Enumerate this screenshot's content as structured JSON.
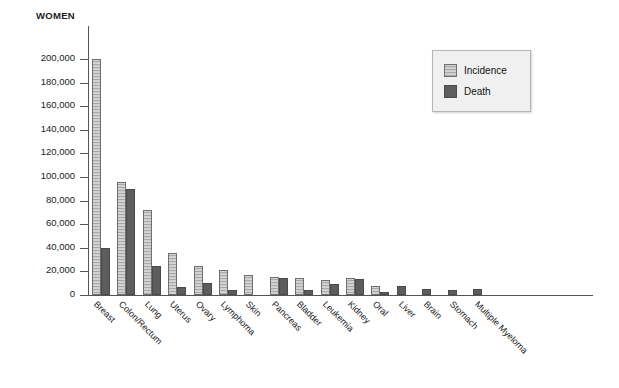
{
  "chart_data": {
    "type": "bar",
    "title": "",
    "ylabel": "WOMEN",
    "xlabel": "",
    "ylim": [
      0,
      210000
    ],
    "grid": false,
    "legend_position": "top-right",
    "ytick_labels": [
      "200,000",
      "180,000",
      "160,000",
      "140,000",
      "120,000",
      "100,000",
      "80,000",
      "60,000",
      "40,000",
      "20,000",
      "0"
    ],
    "ytick_values": [
      200000,
      180000,
      160000,
      140000,
      120000,
      100000,
      80000,
      60000,
      40000,
      20000,
      0
    ],
    "categories": [
      "Breast",
      "Colon/Rectum",
      "Lung",
      "Uterus",
      "Ovary",
      "Lymphoma",
      "Skin",
      "Pancreas",
      "Bladder",
      "Leukemia",
      "Kidney",
      "Oral",
      "Liver",
      "Brain",
      "Stomach",
      "Multiple Myeloma"
    ],
    "series": [
      {
        "name": "Incidence",
        "color": "#cfcfcf",
        "values": [
          200000,
          96000,
          72000,
          36000,
          25000,
          21000,
          17000,
          15500,
          14000,
          12500,
          14000,
          8000,
          0,
          0,
          0,
          0
        ]
      },
      {
        "name": "Death",
        "color": "#5d5d5d",
        "values": [
          40000,
          90000,
          25000,
          6500,
          10500,
          4500,
          0,
          14500,
          4000,
          9500,
          13500,
          2500,
          8000,
          5000,
          4500,
          5000
        ]
      }
    ]
  },
  "legend": {
    "items": [
      {
        "label": "Incidence",
        "swatch": "hatched-light"
      },
      {
        "label": "Death",
        "swatch": "solid-dark"
      }
    ]
  },
  "axis": {
    "y_title": "WOMEN"
  }
}
